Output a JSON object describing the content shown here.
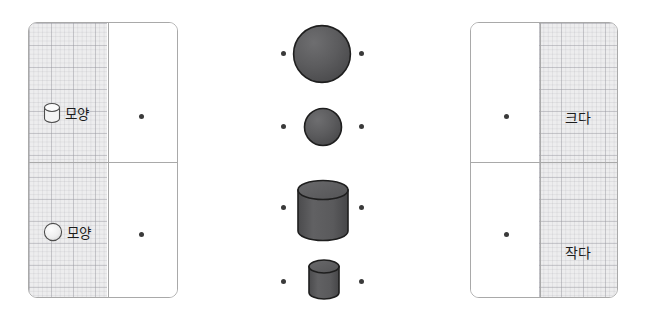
{
  "exercise": {
    "type": "matching",
    "language": "ko",
    "left_panel": {
      "name": "shape-attribute-panel",
      "rows": [
        {
          "id": "cylinder-row",
          "icon": "cylinder-icon",
          "label": "모양",
          "connector": "dot"
        },
        {
          "id": "sphere-row",
          "icon": "sphere-icon",
          "label": "모양",
          "connector": "dot"
        }
      ]
    },
    "center_column": {
      "name": "object-column",
      "items": [
        {
          "id": "large-sphere",
          "icon": "sphere-icon",
          "size": "large",
          "left_dot": "dot",
          "right_dot": "dot"
        },
        {
          "id": "small-sphere",
          "icon": "sphere-icon",
          "size": "small",
          "left_dot": "dot",
          "right_dot": "dot"
        },
        {
          "id": "large-cylinder",
          "icon": "cylinder-icon",
          "size": "large",
          "left_dot": "dot",
          "right_dot": "dot"
        },
        {
          "id": "small-cylinder",
          "icon": "cylinder-icon",
          "size": "small",
          "left_dot": "dot",
          "right_dot": "dot"
        }
      ]
    },
    "right_panel": {
      "name": "size-attribute-panel",
      "rows": [
        {
          "id": "big-row",
          "label": "크다",
          "connector": "dot"
        },
        {
          "id": "small-row",
          "label": "작다",
          "connector": "dot"
        }
      ]
    }
  },
  "colors": {
    "shape_fill": "#5a5a5c",
    "shape_stroke": "#1e1e1e",
    "panel_border": "#a9a9a9",
    "grid_fill": "#ededee",
    "grid_line": "#96969e",
    "dot": "#3a3a3a",
    "text": "#1c1c1c",
    "icon_outline": "#4a4a4a",
    "icon_fill": "#f2f2f2"
  }
}
